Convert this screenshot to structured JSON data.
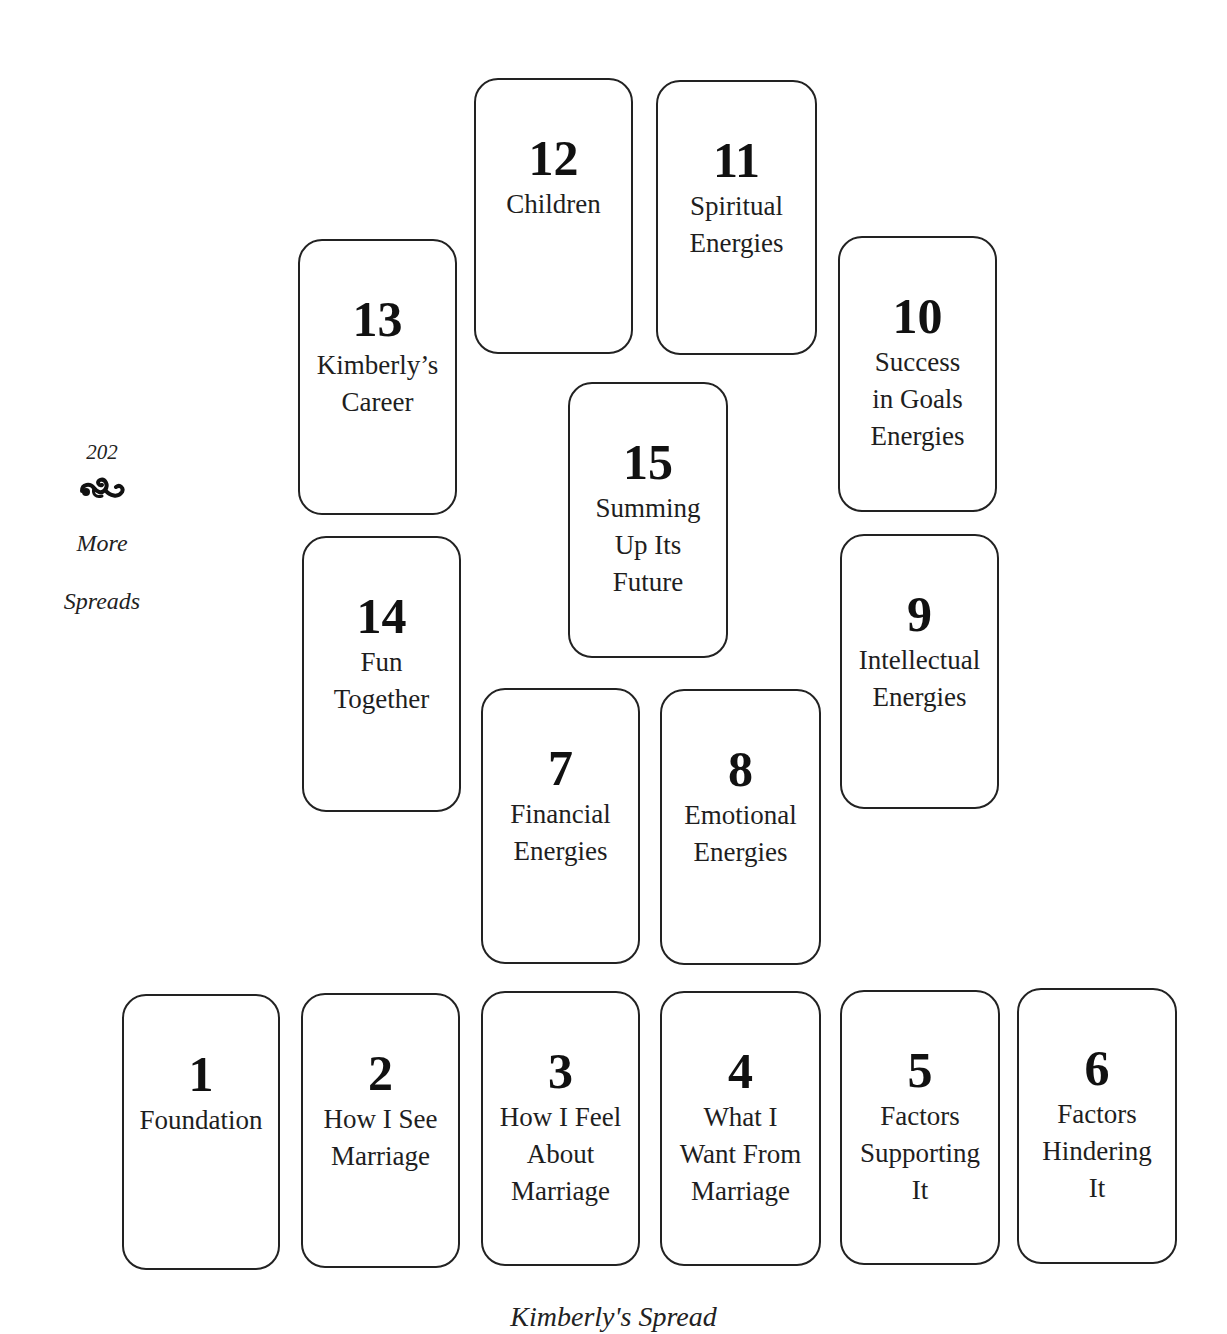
{
  "page": {
    "page_number": "202",
    "ornament_icon": "fleuron-ornament-icon",
    "section_title": "More\nSpreads",
    "caption": "Kimberly's Spread"
  },
  "spread": {
    "cards": [
      {
        "number": "1",
        "label": "Foundation",
        "x": 122,
        "y": 994,
        "w": 158,
        "h": 276
      },
      {
        "number": "2",
        "label": "How I See\nMarriage",
        "x": 301,
        "y": 993,
        "w": 159,
        "h": 275
      },
      {
        "number": "3",
        "label": "How I Feel\nAbout\nMarriage",
        "x": 481,
        "y": 991,
        "w": 159,
        "h": 275
      },
      {
        "number": "4",
        "label": "What I\nWant From\nMarriage",
        "x": 660,
        "y": 991,
        "w": 161,
        "h": 275
      },
      {
        "number": "5",
        "label": "Factors\nSupporting\nIt",
        "x": 840,
        "y": 990,
        "w": 160,
        "h": 275
      },
      {
        "number": "6",
        "label": "Factors\nHindering\nIt",
        "x": 1017,
        "y": 988,
        "w": 160,
        "h": 276
      },
      {
        "number": "7",
        "label": "Financial\nEnergies",
        "x": 481,
        "y": 688,
        "w": 159,
        "h": 276
      },
      {
        "number": "8",
        "label": "Emotional\nEnergies",
        "x": 660,
        "y": 689,
        "w": 161,
        "h": 276
      },
      {
        "number": "9",
        "label": "Intellectual\nEnergies",
        "x": 840,
        "y": 534,
        "w": 159,
        "h": 275
      },
      {
        "number": "10",
        "label": "Success\nin Goals\nEnergies",
        "x": 838,
        "y": 236,
        "w": 159,
        "h": 276
      },
      {
        "number": "11",
        "label": "Spiritual\nEnergies",
        "x": 656,
        "y": 80,
        "w": 161,
        "h": 275
      },
      {
        "number": "12",
        "label": "Children",
        "x": 474,
        "y": 78,
        "w": 159,
        "h": 276
      },
      {
        "number": "13",
        "label": "Kimberly’s\nCareer",
        "x": 298,
        "y": 239,
        "w": 159,
        "h": 276
      },
      {
        "number": "14",
        "label": "Fun\nTogether",
        "x": 302,
        "y": 536,
        "w": 159,
        "h": 276
      },
      {
        "number": "15",
        "label": "Summing\nUp Its\nFuture",
        "x": 568,
        "y": 382,
        "w": 160,
        "h": 276
      }
    ]
  },
  "colors": {
    "background": "#ffffff",
    "border": "#222222",
    "text": "#1a1a1a"
  }
}
